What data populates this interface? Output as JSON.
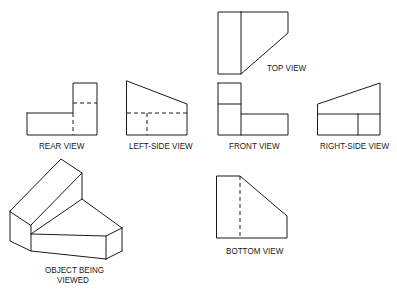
{
  "figure": {
    "views": [
      {
        "id": "top",
        "label": "TOP VIEW"
      },
      {
        "id": "rear",
        "label": "REAR VIEW"
      },
      {
        "id": "left_side",
        "label": "LEFT-SIDE VIEW"
      },
      {
        "id": "front",
        "label": "FRONT VIEW"
      },
      {
        "id": "right_side",
        "label": "RIGHT-SIDE VIEW"
      },
      {
        "id": "bottom",
        "label": "BOTTOM VIEW"
      }
    ],
    "object": {
      "label_line1": "OBJECT BEING",
      "label_line2": "VIEWED"
    },
    "colors": {
      "line": "#1a1a1a",
      "background": "#ffffff"
    }
  }
}
